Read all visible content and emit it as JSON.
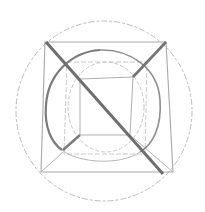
{
  "diagram": {
    "type": "hand-drawn geometric sketch",
    "colors": {
      "background": "#ffffff",
      "faint_line": "#b8b8b8",
      "medium_line": "#9a9a9a",
      "bold_line": "#6e6e6e"
    },
    "elements": [
      {
        "name": "outer-circle",
        "style": "faint"
      },
      {
        "name": "outer-square",
        "style": "faint"
      },
      {
        "name": "inner-square",
        "style": "faint"
      },
      {
        "name": "corner-connectors",
        "style": "faint"
      },
      {
        "name": "middle-circle",
        "style": "bold-partial"
      },
      {
        "name": "inner-ellipse",
        "style": "faint"
      },
      {
        "name": "main-diagonal",
        "style": "bold"
      },
      {
        "name": "upper-right-diagonal",
        "style": "bold"
      },
      {
        "name": "lower-left-diagonal",
        "style": "bold"
      }
    ]
  }
}
